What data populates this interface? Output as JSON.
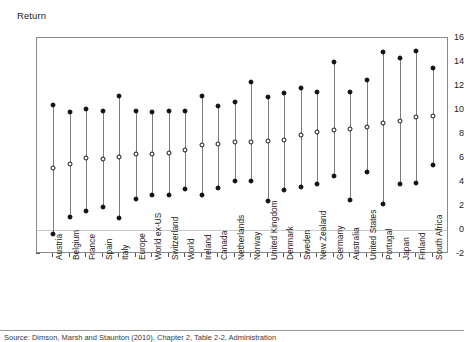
{
  "figure": {
    "axis_title": "Return",
    "caption": "Source: Dimson, Marsh and Staunton (2010), Chapter 2, Table 2-2, Administration"
  },
  "chart_data": {
    "type": "scatter",
    "title": "",
    "subtitle": "",
    "xlabel": "",
    "ylabel": "Return",
    "ylim": [
      -2,
      16
    ],
    "yticks": [
      -2,
      0,
      2,
      4,
      6,
      8,
      10,
      12,
      14,
      16
    ],
    "ytick_labels": [
      "-2",
      "0",
      "2",
      "4",
      "6",
      "8",
      "10",
      "12",
      "14",
      "16"
    ],
    "grid": false,
    "zero_line": true,
    "legend": [],
    "marker_styles": {
      "high": "filled-circle",
      "mid": "open-circle",
      "low": "filled-circle"
    },
    "categories": [
      "Austria",
      "Belgium",
      "France",
      "Spain",
      "Italy",
      "Europe",
      "World ex-US",
      "Switzerland",
      "World",
      "Ireland",
      "Canada",
      "Netherlands",
      "Norway",
      "United Kingdom",
      "Denmark",
      "Sweden",
      "New Zealand",
      "Germany",
      "Australia",
      "United States",
      "Portugal",
      "Japan",
      "Finland",
      "South Africa"
    ],
    "series": [
      {
        "name": "High",
        "values": [
          10.4,
          9.8,
          10.1,
          9.9,
          11.2,
          9.9,
          9.8,
          9.9,
          9.9,
          11.2,
          10.3,
          10.7,
          12.3,
          11.1,
          11.4,
          11.8,
          11.5,
          14.0,
          11.5,
          12.5,
          14.8,
          14.3,
          14.9,
          13.5
        ]
      },
      {
        "name": "Mid",
        "values": [
          5.2,
          5.5,
          6.0,
          5.9,
          6.1,
          6.3,
          6.3,
          6.4,
          6.7,
          7.1,
          7.2,
          7.3,
          7.3,
          7.4,
          7.5,
          7.9,
          8.2,
          8.3,
          8.4,
          8.6,
          8.9,
          9.1,
          9.4,
          9.5
        ]
      },
      {
        "name": "Low",
        "values": [
          -0.3,
          1.1,
          1.6,
          1.9,
          1.0,
          2.6,
          2.9,
          2.9,
          3.4,
          2.9,
          3.5,
          4.1,
          4.1,
          2.4,
          3.3,
          3.6,
          3.8,
          4.5,
          2.5,
          4.8,
          2.2,
          3.8,
          3.9,
          5.4
        ]
      }
    ]
  }
}
